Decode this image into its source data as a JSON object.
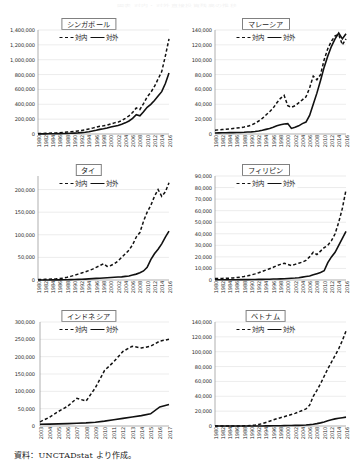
{
  "document": {
    "cut_off_header": "図表 対内・対外直接投資残高の推移",
    "source_note": "資料：UNCTADstat より作成。"
  },
  "legend": {
    "inward_label": "対内",
    "outward_label": "対外",
    "inward_style": "dashed",
    "outward_style": "solid",
    "color": "#111111"
  },
  "chart_data": [
    {
      "type": "line",
      "title": "シンガポール",
      "xlabel": "",
      "ylabel": "",
      "ylim": [
        0,
        1400000
      ],
      "yticks": [
        "0",
        "200,000",
        "400,000",
        "600,000",
        "800,000",
        "1,000,000",
        "1,200,000",
        "1,400,000"
      ],
      "grid": true,
      "legend_position": "top-center",
      "x": [
        1980,
        1981,
        1982,
        1983,
        1984,
        1985,
        1986,
        1987,
        1988,
        1989,
        1990,
        1991,
        1992,
        1993,
        1994,
        1995,
        1996,
        1997,
        1998,
        1999,
        2000,
        2001,
        2002,
        2003,
        2004,
        2005,
        2006,
        2007,
        2008,
        2009,
        2010,
        2011,
        2012,
        2013,
        2014,
        2015,
        2016
      ],
      "xtick_labels": [
        "1980",
        "1982",
        "1984",
        "1986",
        "1988",
        "1990",
        "1992",
        "1994",
        "1996",
        "1998",
        "2000",
        "2002",
        "2004",
        "2006",
        "2008",
        "2010",
        "2012",
        "2014",
        "2016"
      ],
      "series": [
        {
          "name": "対内",
          "values": [
            6200,
            7500,
            9000,
            11000,
            13000,
            15000,
            18000,
            22000,
            26000,
            30000,
            35000,
            41000,
            48000,
            57000,
            68000,
            79000,
            92000,
            105000,
            110000,
            120000,
            135000,
            150000,
            160000,
            180000,
            210000,
            245000,
            290000,
            350000,
            330000,
            410000,
            500000,
            560000,
            640000,
            740000,
            840000,
            1050000,
            1280000
          ]
        },
        {
          "name": "対外",
          "values": [
            1200,
            1500,
            1900,
            2400,
            3000,
            3800,
            4800,
            6000,
            7500,
            9500,
            12000,
            15000,
            19000,
            24000,
            31000,
            40000,
            50000,
            62000,
            70000,
            80000,
            95000,
            105000,
            115000,
            130000,
            150000,
            175000,
            210000,
            260000,
            245000,
            300000,
            360000,
            400000,
            450000,
            510000,
            570000,
            680000,
            820000
          ]
        }
      ]
    },
    {
      "type": "line",
      "title": "マレーシア",
      "xlabel": "",
      "ylabel": "",
      "ylim": [
        0,
        140000
      ],
      "yticks": [
        "0",
        "20,000",
        "40,000",
        "60,000",
        "80,000",
        "100,000",
        "120,000",
        "140,000"
      ],
      "grid": true,
      "legend_position": "top-center",
      "x": [
        1980,
        1981,
        1982,
        1983,
        1984,
        1985,
        1986,
        1987,
        1988,
        1989,
        1990,
        1991,
        1992,
        1993,
        1994,
        1995,
        1996,
        1997,
        1998,
        1999,
        2000,
        2001,
        2002,
        2003,
        2004,
        2005,
        2006,
        2007,
        2008,
        2009,
        2010,
        2011,
        2012,
        2013,
        2014,
        2015,
        2016
      ],
      "xtick_labels": [
        "1980",
        "1982",
        "1984",
        "1986",
        "1988",
        "1990",
        "1992",
        "1994",
        "1996",
        "1998",
        "2000",
        "2002",
        "2004",
        "2006",
        "2008",
        "2010",
        "2012",
        "2014",
        "2016"
      ],
      "series": [
        {
          "name": "対内",
          "values": [
            5200,
            5600,
            6000,
            6400,
            6800,
            7400,
            8000,
            8600,
            9400,
            10500,
            12000,
            14500,
            17500,
            21000,
            25500,
            30000,
            35000,
            42000,
            48000,
            52000,
            38000,
            36000,
            38000,
            42000,
            46000,
            50000,
            62000,
            78000,
            73000,
            80000,
            100000,
            115000,
            125000,
            132000,
            134000,
            120000,
            128000
          ]
        },
        {
          "name": "対外",
          "values": [
            1400,
            1500,
            1600,
            1700,
            1800,
            1900,
            2000,
            2100,
            2300,
            2600,
            2900,
            3400,
            4100,
            5000,
            6200,
            7500,
            9000,
            11000,
            12500,
            13500,
            14000,
            7500,
            9000,
            11000,
            14000,
            16000,
            25000,
            40000,
            55000,
            72000,
            90000,
            105000,
            118000,
            128000,
            136000,
            128000,
            135000
          ]
        }
      ]
    },
    {
      "type": "line",
      "title": "タイ",
      "xlabel": "",
      "ylabel": "",
      "ylim": [
        0,
        230000
      ],
      "yticks": [
        "0",
        "50,000",
        "100,000",
        "150,000",
        "200,000"
      ],
      "grid": true,
      "legend_position": "top-center",
      "x": [
        1980,
        1981,
        1982,
        1983,
        1984,
        1985,
        1986,
        1987,
        1988,
        1989,
        1990,
        1991,
        1992,
        1993,
        1994,
        1995,
        1996,
        1997,
        1998,
        1999,
        2000,
        2001,
        2002,
        2003,
        2004,
        2005,
        2006,
        2007,
        2008,
        2009,
        2010,
        2011,
        2012,
        2013,
        2014,
        2015,
        2016
      ],
      "xtick_labels": [
        "1980",
        "1982",
        "1984",
        "1986",
        "1988",
        "1990",
        "1992",
        "1994",
        "1996",
        "1998",
        "2000",
        "2002",
        "2004",
        "2006",
        "2008",
        "2010",
        "2012",
        "2014",
        "2016"
      ],
      "series": [
        {
          "name": "対内",
          "values": [
            1000,
            1200,
            1400,
            1700,
            2000,
            2500,
            3200,
            4200,
            6000,
            8000,
            10500,
            13000,
            15500,
            18000,
            21000,
            24000,
            28000,
            32000,
            36000,
            30000,
            32000,
            36000,
            42000,
            50000,
            58000,
            66000,
            78000,
            95000,
            105000,
            130000,
            150000,
            165000,
            185000,
            200000,
            185000,
            195000,
            215000
          ]
        },
        {
          "name": "対外",
          "values": [
            100,
            120,
            140,
            170,
            200,
            250,
            320,
            420,
            600,
            800,
            1000,
            1300,
            1600,
            2000,
            2500,
            3000,
            3500,
            4000,
            4500,
            5000,
            5500,
            6000,
            6500,
            7000,
            8000,
            9000,
            11000,
            13000,
            16000,
            20000,
            28000,
            45000,
            58000,
            68000,
            80000,
            95000,
            108000
          ]
        }
      ]
    },
    {
      "type": "line",
      "title": "フィリピン",
      "xlabel": "",
      "ylabel": "",
      "ylim": [
        0,
        90000
      ],
      "yticks": [
        "0",
        "10,000",
        "20,000",
        "30,000",
        "40,000",
        "50,000",
        "60,000",
        "70,000",
        "80,000",
        "90,000"
      ],
      "grid": true,
      "legend_position": "top-center",
      "x": [
        1980,
        1981,
        1982,
        1983,
        1984,
        1985,
        1986,
        1987,
        1988,
        1989,
        1990,
        1991,
        1992,
        1993,
        1994,
        1995,
        1996,
        1997,
        1998,
        1999,
        2000,
        2001,
        2002,
        2003,
        2004,
        2005,
        2006,
        2007,
        2008,
        2009,
        2010,
        2011,
        2012,
        2013,
        2014,
        2015,
        2016
      ],
      "xtick_labels": [
        "1980",
        "1982",
        "1984",
        "1986",
        "1988",
        "1990",
        "1992",
        "1994",
        "1996",
        "1998",
        "2000",
        "2002",
        "2004",
        "2006",
        "2008",
        "2010",
        "2012",
        "2014",
        "2016"
      ],
      "series": [
        {
          "name": "対内",
          "values": [
            1200,
            1300,
            1400,
            1500,
            1600,
            1800,
            2100,
            2500,
            3000,
            3600,
            4400,
            5300,
            6300,
            7400,
            8600,
            9800,
            11000,
            12500,
            13500,
            14500,
            13500,
            12500,
            13500,
            14500,
            15500,
            17000,
            20000,
            24000,
            22000,
            25000,
            28000,
            30000,
            34000,
            40000,
            50000,
            62000,
            78000
          ]
        },
        {
          "name": "対外",
          "values": [
            200,
            210,
            220,
            230,
            240,
            260,
            280,
            300,
            330,
            360,
            400,
            450,
            500,
            560,
            620,
            700,
            800,
            900,
            1000,
            1100,
            1300,
            1500,
            1700,
            2000,
            2500,
            3000,
            3500,
            4500,
            5500,
            6500,
            8000,
            15000,
            20000,
            24000,
            30000,
            36000,
            42000
          ]
        }
      ]
    },
    {
      "type": "line",
      "title": "インドネシア",
      "xlabel": "",
      "ylabel": "",
      "ylim": [
        0,
        300000
      ],
      "yticks": [
        "0",
        "50,000",
        "100,000",
        "150,000",
        "200,000",
        "250,000",
        "300,000"
      ],
      "grid": true,
      "legend_position": "top-center",
      "x": [
        2003,
        2004,
        2005,
        2006,
        2007,
        2008,
        2009,
        2010,
        2011,
        2012,
        2013,
        2014,
        2015,
        2016,
        2017
      ],
      "xtick_labels": [
        "2003",
        "2004",
        "2005",
        "2006",
        "2007",
        "2008",
        "2009",
        "2010",
        "2011",
        "2012",
        "2013",
        "2014",
        "2015",
        "2016",
        "2017"
      ],
      "series": [
        {
          "name": "対内",
          "values": [
            12000,
            25000,
            42000,
            57000,
            80000,
            72000,
            110000,
            160000,
            185000,
            215000,
            230000,
            225000,
            230000,
            245000,
            250000
          ]
        },
        {
          "name": "対外",
          "values": [
            5000,
            5500,
            6000,
            7000,
            8000,
            9000,
            11000,
            14000,
            18000,
            22000,
            26000,
            30000,
            35000,
            55000,
            62000
          ]
        }
      ]
    },
    {
      "type": "line",
      "title": "ベトナム",
      "xlabel": "",
      "ylabel": "",
      "ylim": [
        0,
        140000
      ],
      "yticks": [
        "0",
        "20,000",
        "40,000",
        "60,000",
        "80,000",
        "100,000",
        "120,000",
        "140,000"
      ],
      "grid": true,
      "legend_position": "top-center",
      "x": [
        1980,
        1981,
        1982,
        1983,
        1984,
        1985,
        1986,
        1987,
        1988,
        1989,
        1990,
        1991,
        1992,
        1993,
        1994,
        1995,
        1996,
        1997,
        1998,
        1999,
        2000,
        2001,
        2002,
        2003,
        2004,
        2005,
        2006,
        2007,
        2008,
        2009,
        2010,
        2011,
        2012,
        2013,
        2014,
        2015,
        2016
      ],
      "xtick_labels": [
        "1980",
        "1982",
        "1984",
        "1986",
        "1988",
        "1990",
        "1992",
        "1994",
        "1996",
        "1998",
        "2000",
        "2002",
        "2004",
        "2006",
        "2008",
        "2010",
        "2012",
        "2014",
        "2016"
      ],
      "series": [
        {
          "name": "対内",
          "values": [
            0,
            0,
            0,
            0,
            0,
            0,
            0,
            0,
            200,
            400,
            700,
            1200,
            2000,
            3200,
            4800,
            6500,
            8200,
            9800,
            11200,
            12500,
            14000,
            15500,
            17000,
            19000,
            21000,
            23000,
            28000,
            40000,
            48000,
            57000,
            67000,
            77000,
            86000,
            95000,
            104000,
            115000,
            128000
          ]
        },
        {
          "name": "対外",
          "values": [
            0,
            0,
            0,
            0,
            0,
            0,
            0,
            0,
            0,
            0,
            0,
            0,
            50,
            100,
            150,
            200,
            260,
            320,
            400,
            500,
            600,
            700,
            800,
            900,
            1100,
            1400,
            1800,
            2400,
            3200,
            4200,
            5500,
            7000,
            8400,
            9600,
            10500,
            11200,
            12000
          ]
        }
      ]
    }
  ]
}
